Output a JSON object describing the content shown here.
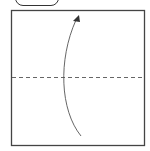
{
  "diagram": {
    "type": "origami-fold-step",
    "step_tab": {
      "label": ""
    },
    "paper": {
      "shape": "square",
      "border_color": "#444444",
      "fill": "#ffffff"
    },
    "fold_line": {
      "style": "valley-fold-dashed",
      "orientation": "horizontal",
      "position": "middle",
      "color": "#666666"
    },
    "arrow": {
      "direction": "up",
      "description": "fold bottom half up to top",
      "color": "#555555"
    }
  }
}
